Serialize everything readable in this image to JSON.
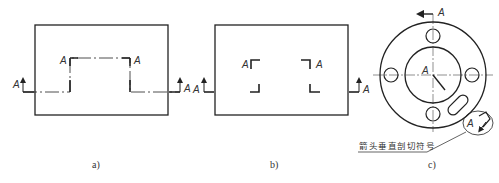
{
  "figure": {
    "section_letter": "A",
    "panels": [
      {
        "id": "a",
        "caption": "a)"
      },
      {
        "id": "b",
        "caption": "b)"
      },
      {
        "id": "c",
        "caption": "c)"
      }
    ],
    "annotation": "箭头垂直剖切符号",
    "colors": {
      "line": "#222222",
      "background": "#ffffff"
    }
  }
}
